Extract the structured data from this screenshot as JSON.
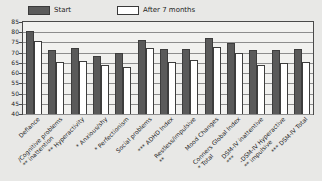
{
  "legend": {
    "entries": [
      {
        "label": "Start",
        "color": "#5a5a5a",
        "key": "start"
      },
      {
        "label": "After 7 months",
        "color": "#ffffff",
        "key": "after"
      }
    ]
  },
  "axes": {
    "y_ticks": [
      "85",
      "80",
      "75",
      "70",
      "65",
      "60",
      "55",
      "50",
      "45",
      "40"
    ]
  },
  "chart_data": {
    "type": "bar",
    "title": "",
    "subtitle": "",
    "xlabel": "",
    "ylabel": "",
    "ylim": [
      40,
      85
    ],
    "ytick_step": 5,
    "grid": true,
    "legend_position": "top-left",
    "categories": [
      "Defiance",
      "Cognitive problems/ inattention **",
      "Hyperactivity **",
      "Anxious/shy *",
      "Perfectionism *",
      "Social problems",
      "ADHD Index ***",
      "Restless/impulsive **",
      "Mood Changes",
      "Conners Global Index Total *",
      "DSM-IV inattentive ***",
      "DSM-IV Hyperactive- impulsive **",
      "DSM-IV Total ***"
    ],
    "series": [
      {
        "name": "Start",
        "color": "#5a5a5a",
        "values": [
          80.5,
          71.5,
          72.5,
          68.5,
          70.0,
          76.0,
          72.0,
          72.0,
          77.0,
          74.5,
          71.5,
          71.5,
          72.0
        ]
      },
      {
        "name": "After 7 months",
        "color": "#ffffff",
        "values": [
          75.5,
          65.5,
          66.0,
          64.0,
          63.0,
          72.5,
          65.5,
          66.5,
          73.0,
          70.0,
          64.0,
          65.0,
          65.5
        ]
      }
    ]
  }
}
